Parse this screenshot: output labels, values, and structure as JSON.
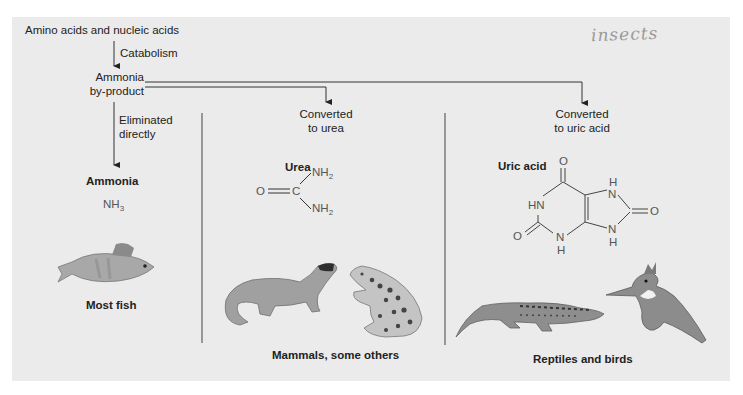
{
  "diagram": {
    "source_label": "Amino acids and nucleic acids",
    "process_label": "Catabolism",
    "intermediate_label_line1": "Ammonia",
    "intermediate_label_line2": "by-product",
    "handwritten_note": "insects",
    "branches": [
      {
        "path_label_line1": "Eliminated",
        "path_label_line2": "directly",
        "compound_name": "Ammonia",
        "formula_main": "NH",
        "formula_sub": "3",
        "organisms_label": "Most fish",
        "illustration": "fish"
      },
      {
        "path_label_line1": "Converted",
        "path_label_line2": "to urea",
        "compound_name": "Urea",
        "structure_atoms": {
          "o": "O",
          "c": "C",
          "nh2_top": "NH",
          "nh2_bottom": "NH",
          "sub": "2"
        },
        "organisms_label": "Mammals, some others",
        "illustration": [
          "ferret",
          "frog"
        ]
      },
      {
        "path_label_line1": "Converted",
        "path_label_line2": "to uric acid",
        "compound_name": "Uric acid",
        "structure_atoms": {
          "o_top": "O",
          "o_right": "O",
          "o_left": "O",
          "hn": "HN",
          "n": "N",
          "h": "H"
        },
        "organisms_label": "Reptiles and birds",
        "illustration": [
          "lizard",
          "kingfisher"
        ]
      }
    ]
  },
  "colors": {
    "panel_bg": "#ebebeb",
    "line": "#3a3a3a",
    "text": "#222222",
    "note": "#9a9a9a"
  }
}
